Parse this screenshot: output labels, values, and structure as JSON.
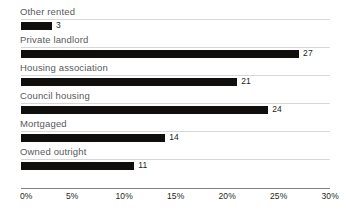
{
  "chart_data": {
    "type": "bar",
    "orientation": "horizontal",
    "title": "",
    "subtitle": "",
    "xlabel": "",
    "ylabel": "",
    "xlim": [
      0,
      30
    ],
    "grid": false,
    "legend": false,
    "categories": [
      "Other rented",
      "Private landlord",
      "Housing association",
      "Council housing",
      "Mortgaged",
      "Owned outright"
    ],
    "values": [
      3,
      27,
      21,
      24,
      14,
      11
    ],
    "value_labels": [
      "3",
      "27",
      "21",
      "24",
      "14",
      "11"
    ],
    "xticks": [
      0,
      5,
      10,
      15,
      20,
      25,
      30
    ],
    "xtick_labels": [
      "0%",
      "5%",
      "10%",
      "15%",
      "20%",
      "25%",
      "30%"
    ],
    "bar_color": "#100f0d",
    "label_color": "#58595b",
    "axis_color": "#808285",
    "rule_color": "#d6d7d8",
    "background": "#ffffff"
  },
  "rows": [
    {
      "label": "Other rented",
      "value": 3,
      "value_label": "3"
    },
    {
      "label": "Private landlord",
      "value": 27,
      "value_label": "27"
    },
    {
      "label": "Housing association",
      "value": 21,
      "value_label": "21"
    },
    {
      "label": "Council housing",
      "value": 24,
      "value_label": "24"
    },
    {
      "label": "Mortgaged",
      "value": 14,
      "value_label": "14"
    },
    {
      "label": "Owned outright",
      "value": 11,
      "value_label": "11"
    }
  ],
  "axis": {
    "ticks": [
      {
        "label": "0%",
        "value": 0
      },
      {
        "label": "5%",
        "value": 5
      },
      {
        "label": "10%",
        "value": 10
      },
      {
        "label": "15%",
        "value": 15
      },
      {
        "label": "20%",
        "value": 20
      },
      {
        "label": "25%",
        "value": 25
      },
      {
        "label": "30%",
        "value": 30
      }
    ]
  }
}
